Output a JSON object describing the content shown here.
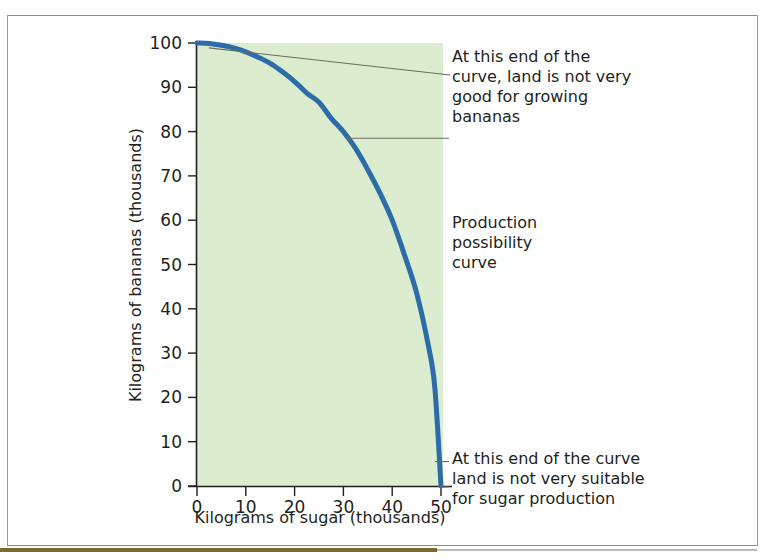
{
  "figure": {
    "background_color": "#ffffff",
    "frame_color": "#8d8d8d",
    "accent_strip_color": "#7d6a2b"
  },
  "chart_data": {
    "type": "line",
    "title": "",
    "subtitle": "",
    "xlabel": "Kilograms of sugar (thousands)",
    "ylabel": "Kilograms of bananas (thousands)",
    "xlim": [
      0,
      50
    ],
    "ylim": [
      0,
      100
    ],
    "xticks": [
      0,
      10,
      20,
      30,
      40,
      50
    ],
    "yticks": [
      0,
      10,
      20,
      30,
      40,
      50,
      60,
      70,
      80,
      90,
      100
    ],
    "grid": false,
    "legend": "none",
    "plot_background_color": "#dbeccf",
    "series": [
      {
        "name": "Production possibility curve",
        "color": "#2c6ca8",
        "line_width": 5,
        "x": [
          0,
          2.5,
          5,
          7.5,
          10,
          12.5,
          15,
          17.5,
          20,
          22.5,
          25,
          27.5,
          30,
          32.5,
          35,
          37.5,
          40,
          42.5,
          45,
          47.5,
          48.75,
          50
        ],
        "y": [
          100,
          99.9,
          99.5,
          98.9,
          98.0,
          96.8,
          95.4,
          93.5,
          91.3,
          88.7,
          86.6,
          83.0,
          80.0,
          76.2,
          71.4,
          66.1,
          60.0,
          52.2,
          43.6,
          31.2,
          22.0,
          0
        ]
      }
    ],
    "annotations": [
      {
        "id": "annotation-top",
        "text": "At this end of the\ncurve, land is not very\ngood for growing\nbananas",
        "lines": [
          "At this end of the",
          "curve, land is not very",
          "good for growing",
          "bananas"
        ],
        "points_to": {
          "x": 0.8,
          "y": 99.8
        },
        "leader_color": "#6b6b60"
      },
      {
        "id": "annotation-middle",
        "text": "Production\npossibility\ncurve",
        "lines": [
          "Production",
          "possibility",
          "curve"
        ],
        "points_to": {
          "x": 30.5,
          "y": 78.5
        },
        "leader_color": "#6b6b60"
      },
      {
        "id": "annotation-bottom",
        "text": "At this end of the curve\nland is not very suitable\nfor sugar production",
        "lines": [
          "At this end of the curve",
          "land is not very suitable",
          "for sugar production"
        ],
        "points_to": {
          "x": 49.6,
          "y": 5.5
        },
        "leader_color": "#6b6b60"
      }
    ],
    "axis": {
      "color": "#231f20",
      "tick_color": "#231f20",
      "origin_label": "0"
    }
  }
}
